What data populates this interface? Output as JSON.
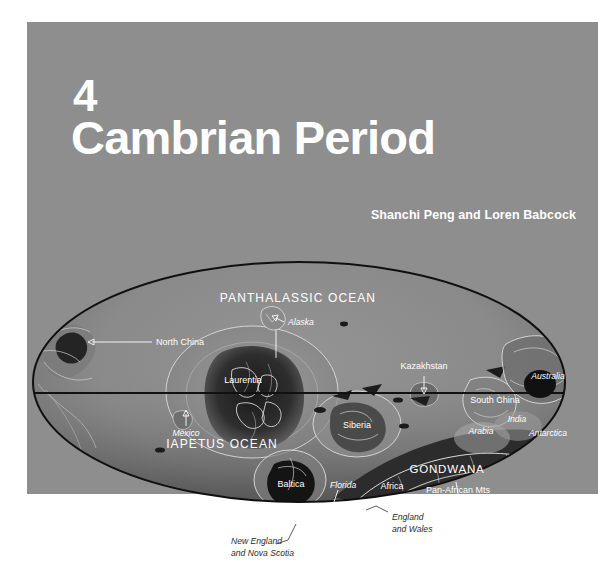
{
  "page": {
    "background_color": "#ffffff",
    "panel_color": "#8e8e8e"
  },
  "title_block": {
    "chapter_number": "4",
    "chapter_title": "Cambrian Period",
    "authors": "Shanchi Peng and Loren Babcock"
  },
  "map": {
    "projection_note": "elliptical world map, Cambrian paleogeography",
    "equator_label": "",
    "oceans": [
      {
        "name": "PANTHALASSIC OCEAN",
        "x": 298,
        "y": 58
      },
      {
        "name": "IAPETUS OCEAN",
        "x": 222,
        "y": 204
      }
    ],
    "supercontinents": [
      {
        "name": "GONDWANA",
        "x": 447,
        "y": 229
      }
    ],
    "continents": [
      {
        "name": "Laurentia",
        "x": 243,
        "y": 139
      },
      {
        "name": "Siberia",
        "x": 357,
        "y": 184
      },
      {
        "name": "Kazakhstan",
        "x": 424,
        "y": 135
      },
      {
        "name": "South China",
        "x": 495,
        "y": 159
      },
      {
        "name": "Baltica",
        "x": 291,
        "y": 243
      },
      {
        "name": "North China",
        "x": 121,
        "y": 101
      }
    ],
    "regions": [
      {
        "name": "Alaska",
        "x": 288,
        "y": 81
      },
      {
        "name": "Mexico",
        "x": 182,
        "y": 187
      },
      {
        "name": "Florida",
        "x": 338,
        "y": 242
      },
      {
        "name": "Africa",
        "x": 392,
        "y": 245
      },
      {
        "name": "Arabia",
        "x": 481,
        "y": 190
      },
      {
        "name": "India",
        "x": 515,
        "y": 180
      },
      {
        "name": "Australia",
        "x": 548,
        "y": 135
      },
      {
        "name": "Antarctica",
        "x": 546,
        "y": 192
      },
      {
        "name": "Pan-African Mts",
        "x": 456,
        "y": 246
      },
      {
        "name": "South America",
        "x": 345,
        "y": 276
      }
    ],
    "outside_labels": [
      {
        "line1": "New England",
        "line2": "and Nova Scotia",
        "x": 231,
        "y": 296
      },
      {
        "line1": "England",
        "line2": "and Wales",
        "x": 392,
        "y": 272
      }
    ],
    "colors": {
      "ocean_shallow": "#8d8d8d",
      "ocean_deep": "#5b5b5b",
      "land_dark": "#2a2a2a",
      "coastline": "#d8d8d8",
      "outline": "#111111",
      "equator": "#111111"
    }
  }
}
